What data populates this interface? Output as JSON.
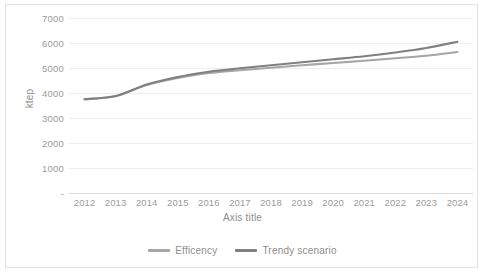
{
  "chart_data": {
    "type": "line",
    "title": "",
    "xlabel": "Axis title",
    "ylabel": "ktep",
    "categories": [
      "2012",
      "2013",
      "2014",
      "2015",
      "2016",
      "2017",
      "2018",
      "2019",
      "2020",
      "2021",
      "2022",
      "2023",
      "2024"
    ],
    "x": [
      2012,
      2013,
      2014,
      2015,
      2016,
      2017,
      2018,
      2019,
      2020,
      2021,
      2022,
      2023,
      2024
    ],
    "ylim": [
      0,
      7000
    ],
    "ytick_labels": [
      "7000",
      "6000",
      "5000",
      "4000",
      "3000",
      "2000",
      "1000",
      "-"
    ],
    "ytick_values": [
      7000,
      6000,
      5000,
      4000,
      3000,
      2000,
      1000,
      0
    ],
    "grid": true,
    "legend_position": "bottom",
    "series": [
      {
        "name": "Efficency",
        "color": "#a6a6a6",
        "values": [
          3750,
          3870,
          4320,
          4600,
          4800,
          4910,
          5010,
          5110,
          5200,
          5290,
          5390,
          5490,
          5640
        ]
      },
      {
        "name": "Trendy scenario",
        "color": "#808080",
        "values": [
          3750,
          3880,
          4340,
          4640,
          4850,
          4990,
          5110,
          5230,
          5350,
          5470,
          5620,
          5800,
          6050
        ]
      }
    ]
  },
  "legend": {
    "items": [
      {
        "label": "Efficency",
        "color": "#a6a6a6"
      },
      {
        "label": "Trendy scenario",
        "color": "#808080"
      }
    ]
  },
  "axes": {
    "y_title": "ktep",
    "x_title": "Axis title"
  },
  "colors": {
    "grid": "#eceded",
    "frame": "#e3e3e3",
    "tick_text": "#9b9b9b",
    "axis_title_text": "#8d8d8d",
    "background": "#ffffff"
  }
}
